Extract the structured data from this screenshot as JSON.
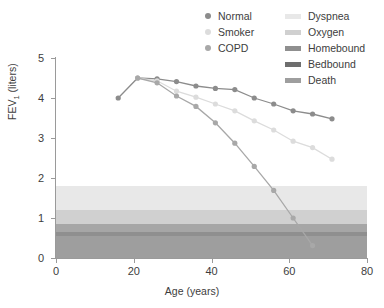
{
  "chart_data": {
    "type": "line",
    "title": "",
    "xlabel": "Age (years)",
    "ylabel": "FEV1 (liters)",
    "ylabel_main": "FEV",
    "ylabel_sub": "1",
    "ylabel_unit": " (liters)",
    "xlim": [
      0,
      80
    ],
    "ylim": [
      0,
      5
    ],
    "xticks": [
      0,
      20,
      40,
      60,
      80
    ],
    "yticks": [
      0,
      1,
      2,
      3,
      4,
      5
    ],
    "grid": false,
    "legend_position": "top-right",
    "series": [
      {
        "name": "Normal",
        "color": "#8c8c8c",
        "x": [
          16,
          21,
          26,
          31,
          36,
          41,
          46,
          51,
          56,
          61,
          66,
          71
        ],
        "y": [
          4.0,
          4.5,
          4.48,
          4.41,
          4.3,
          4.24,
          4.21,
          4.0,
          3.85,
          3.68,
          3.6,
          3.48
        ]
      },
      {
        "name": "Smoker",
        "color": "#dcdcdc",
        "x": [
          21,
          26,
          31,
          36,
          41,
          46,
          51,
          56,
          61,
          66,
          71
        ],
        "y": [
          4.5,
          4.43,
          4.17,
          4.02,
          3.85,
          3.68,
          3.43,
          3.2,
          2.92,
          2.76,
          2.47
        ]
      },
      {
        "name": "COPD",
        "color": "#a8a8a8",
        "x": [
          21,
          26,
          31,
          36,
          41,
          46,
          51,
          56,
          61,
          66
        ],
        "y": [
          4.5,
          4.38,
          4.05,
          3.79,
          3.38,
          2.87,
          2.29,
          1.69,
          1.0,
          0.31
        ]
      }
    ],
    "bands": [
      {
        "name": "Dyspnea",
        "color": "#e8e8e8",
        "y0": 1.2,
        "y1": 1.8
      },
      {
        "name": "Oxygen",
        "color": "#d0d0d0",
        "y0": 0.85,
        "y1": 1.2
      },
      {
        "name": "Homebound",
        "color": "#a6a6a6",
        "y0": 0.65,
        "y1": 0.85
      },
      {
        "name": "Bedbound",
        "color": "#8f8f8f",
        "y0": 0.55,
        "y1": 0.65
      },
      {
        "name": "Death",
        "color": "#9e9e9e",
        "y0": 0.0,
        "y1": 0.55
      }
    ]
  },
  "legend": {
    "series_entries": [
      {
        "label": "Normal",
        "color": "#8c8c8c"
      },
      {
        "label": "Smoker",
        "color": "#dcdcdc"
      },
      {
        "label": "COPD",
        "color": "#a8a8a8"
      }
    ],
    "band_entries": [
      {
        "label": "Dyspnea",
        "color": "#e8e8e8"
      },
      {
        "label": "Oxygen",
        "color": "#d0d0d0"
      },
      {
        "label": "Homebound",
        "color": "#8f8f8f"
      },
      {
        "label": "Bedbound",
        "color": "#6e6e6e"
      },
      {
        "label": "Death",
        "color": "#9e9e9e"
      }
    ]
  },
  "axes": {
    "x_tick_labels": [
      "0",
      "20",
      "40",
      "60",
      "80"
    ],
    "y_tick_labels": [
      "0",
      "1",
      "2",
      "3",
      "4",
      "5"
    ],
    "x_title": "Age (years)"
  }
}
